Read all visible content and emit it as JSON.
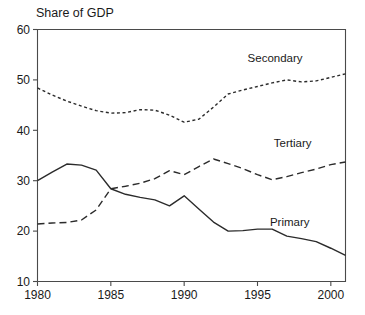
{
  "chart_data": {
    "type": "line",
    "title": "Share of GDP",
    "xlabel": "",
    "ylabel": "",
    "xlim": [
      1980,
      2001
    ],
    "ylim": [
      10,
      60
    ],
    "grid": false,
    "legend_position": "inline-right-of-series",
    "x": [
      1980,
      1981,
      1982,
      1983,
      1984,
      1985,
      1986,
      1987,
      1988,
      1989,
      1990,
      1991,
      1992,
      1993,
      1994,
      1995,
      1996,
      1997,
      1998,
      1999,
      2000,
      2001
    ],
    "xticks": [
      1980,
      1985,
      1990,
      1995,
      2000
    ],
    "xtick_labels": [
      "1980",
      "1985",
      "1990",
      "1995",
      "2000"
    ],
    "yticks": [
      10,
      20,
      30,
      40,
      50,
      60
    ],
    "ytick_labels": [
      "10",
      "20",
      "30",
      "40",
      "50",
      "60"
    ],
    "series": [
      {
        "name": "Secondary",
        "style": "dotted",
        "label": "Secondary",
        "label_x": 1996.2,
        "label_y": 53.6,
        "values": [
          48.4,
          47.0,
          45.8,
          44.8,
          43.9,
          43.4,
          43.5,
          44.1,
          44.0,
          43.0,
          41.6,
          42.2,
          44.6,
          47.2,
          48.0,
          48.7,
          49.4,
          50.0,
          49.6,
          49.8,
          50.5,
          51.2
        ]
      },
      {
        "name": "Tertiary",
        "style": "dashed",
        "label": "Tertiary",
        "label_x": 1997.4,
        "label_y": 36.6,
        "values": [
          21.4,
          21.6,
          21.7,
          22.2,
          24.2,
          28.4,
          28.9,
          29.5,
          30.4,
          32.0,
          31.2,
          32.8,
          34.3,
          33.4,
          32.4,
          31.2,
          30.2,
          30.8,
          31.6,
          32.3,
          33.2,
          33.7
        ]
      },
      {
        "name": "Primary",
        "style": "solid",
        "label": "Primary",
        "label_x": 1997.2,
        "label_y": 21.0,
        "values": [
          30.0,
          31.7,
          33.3,
          33.1,
          32.1,
          28.4,
          27.3,
          26.7,
          26.2,
          25.0,
          27.0,
          24.4,
          21.8,
          20.0,
          20.1,
          20.4,
          20.4,
          19.0,
          18.5,
          17.9,
          16.6,
          15.2
        ]
      }
    ]
  }
}
